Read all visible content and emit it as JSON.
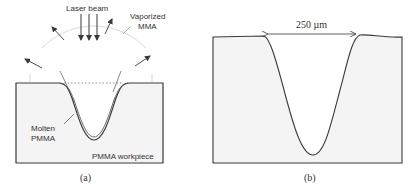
{
  "panel_a": {
    "labels": {
      "laser_beam": "Laser beam",
      "vaporized_line1": "Vaporized",
      "vaporized_line2": "MMA",
      "molten_line1": "Molten",
      "molten_line2": "PMMA",
      "workpiece": "PMMA workpiece"
    },
    "caption": "(a)"
  },
  "panel_b": {
    "dimension_label": "250 µm",
    "caption": "(b)"
  },
  "colors": {
    "stroke": "#3a3a3a",
    "fill": "#f4f4f4",
    "faint": "#cfcfcf",
    "text": "#333333"
  }
}
